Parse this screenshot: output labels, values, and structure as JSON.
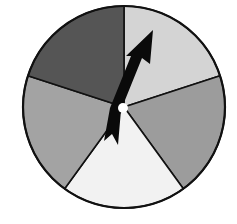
{
  "spinner": {
    "description": "Spinner divided into 5 equal sectors of different gray shades with an arrow pointer",
    "sector_count": 5,
    "center": {
      "x": 124,
      "y": 107
    },
    "radius": 101,
    "outline_color": "#111111",
    "sectors": [
      {
        "name": "sector-top-right",
        "shade": "light gray",
        "fill": "#d4d4d4",
        "start_deg": -90,
        "end_deg": -18
      },
      {
        "name": "sector-right",
        "shade": "medium gray",
        "fill": "#9c9c9c",
        "start_deg": -18,
        "end_deg": 54
      },
      {
        "name": "sector-bottom",
        "shade": "very light gray",
        "fill": "#f2f2f2",
        "start_deg": 54,
        "end_deg": 126
      },
      {
        "name": "sector-left",
        "shade": "medium gray",
        "fill": "#a3a3a3",
        "start_deg": 126,
        "end_deg": 198
      },
      {
        "name": "sector-top-left",
        "shade": "dark gray",
        "fill": "#555555",
        "start_deg": 198,
        "end_deg": 270
      }
    ],
    "arrow": {
      "fill": "#0a0a0a",
      "points_to": "sector-top-right",
      "points": "153,30 150,64 142,58 121,110 118,145 112,134 104,141 110,108 131,56 126,56"
    },
    "hub": {
      "fill": "#ffffff",
      "radius": 5
    }
  }
}
